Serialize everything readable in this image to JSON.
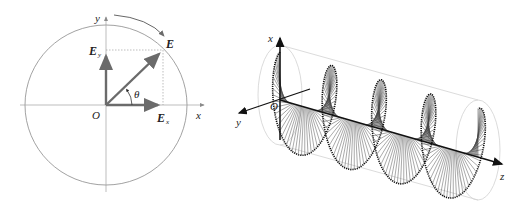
{
  "left_diagram": {
    "title": "circular polarization phasor",
    "labels": {
      "y_axis": "y",
      "x_axis": "x",
      "origin": "O",
      "E": "E",
      "E_y_main": "E",
      "E_y_sub": "y",
      "E_x_main": "E",
      "E_x_sub": "x",
      "theta": "θ"
    },
    "colors": {
      "vector": "#6b6b6b",
      "circle": "#8a8a8a",
      "axis": "#9a9a9a",
      "dotted": "#a0a0a0"
    }
  },
  "right_diagram": {
    "title": "circularly polarized wave propagating along z",
    "labels": {
      "x_axis": "x",
      "y_axis": "y",
      "z_axis": "z",
      "origin": "O"
    },
    "colors": {
      "axis": "#111111",
      "helix": "#333333",
      "cylinder": "#d0d0d0"
    }
  }
}
